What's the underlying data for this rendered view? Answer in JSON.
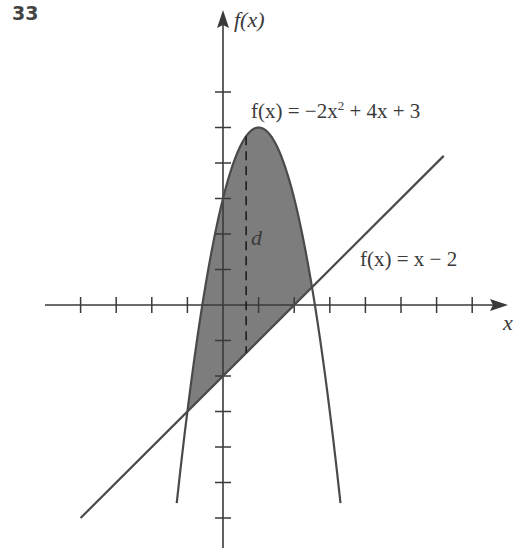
{
  "problem_number": "33",
  "chart_data": {
    "type": "area",
    "title": "",
    "xlabel": "x",
    "ylabel": "f(x)",
    "xlim": [
      -5,
      7.5
    ],
    "ylim": [
      -7,
      6.5
    ],
    "x_ticks": [
      -4,
      -3,
      -2,
      -1,
      1,
      2,
      3,
      4,
      5,
      6,
      7
    ],
    "y_ticks": [
      -6,
      -5,
      -4,
      -3,
      -2,
      -1,
      1,
      2,
      3,
      4,
      5,
      6
    ],
    "tick_labels_shown": false,
    "grid": false,
    "series": [
      {
        "name": "f(x) = -2x^2 + 4x + 3",
        "kind": "parabola",
        "coefficients": {
          "a": -2,
          "b": 4,
          "c": 3
        },
        "x_range": [
          -1.3,
          3.3
        ],
        "vertex": [
          1,
          5
        ]
      },
      {
        "name": "f(x) = x - 2",
        "kind": "line",
        "slope": 1,
        "intercept": -2,
        "x_range": [
          -4,
          6.2
        ]
      }
    ],
    "shaded_region": {
      "between": [
        "f(x) = -2x^2 + 4x + 3",
        "f(x) = x - 2"
      ],
      "x_from": -1,
      "x_to": 2.5,
      "color": "#7a7a7a"
    },
    "intersections": [
      [
        -1,
        -3
      ],
      [
        2.5,
        0.5
      ]
    ],
    "annotations": [
      {
        "text": "d",
        "type": "dashed vertical segment",
        "x": 0.65,
        "description": "vertical distance between the curves"
      },
      {
        "text": "f(x) = −2x² + 4x + 3",
        "position": "above right of vertex"
      },
      {
        "text": "f(x) = x − 2",
        "position": "right, above line"
      }
    ]
  },
  "labels": {
    "y_axis": "f(x)",
    "x_axis": "x",
    "parabola_eq_prefix": "f(x) = −2x",
    "parabola_eq_exp": "2",
    "parabola_eq_suffix": " + 4x + 3",
    "line_eq": "f(x) = x − 2",
    "distance": "d"
  },
  "colors": {
    "ink": "#3a3a3a",
    "shade": "#7d7d7d",
    "background": "#ffffff"
  }
}
